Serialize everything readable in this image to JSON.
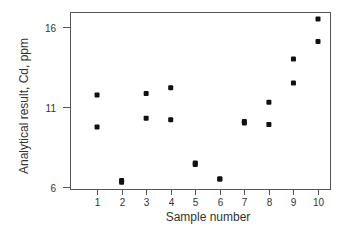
{
  "chart_data": {
    "type": "scatter",
    "title": "",
    "xlabel": "Sample number",
    "ylabel": "Analytical result, Cd, ppm",
    "x_ticks": [
      "1",
      "2",
      "3",
      "4",
      "5",
      "6",
      "7",
      "8",
      "9",
      "10"
    ],
    "y_ticks": [
      "6",
      "11",
      "16"
    ],
    "xlim": [
      0,
      10.5
    ],
    "ylim": [
      5.9,
      16.9
    ],
    "grid": false,
    "legend": null,
    "marker_color": "#111111",
    "series": [
      {
        "name": "Replicate A",
        "x": [
          1,
          2,
          3,
          4,
          5,
          6,
          7,
          8,
          9,
          10
        ],
        "y": [
          11.75,
          6.4,
          11.85,
          12.2,
          7.5,
          6.5,
          10.1,
          11.3,
          14.0,
          16.5
        ]
      },
      {
        "name": "Replicate B",
        "x": [
          1,
          2,
          3,
          4,
          5,
          6,
          7,
          8,
          9,
          10
        ],
        "y": [
          9.75,
          6.3,
          10.3,
          10.2,
          7.4,
          6.5,
          10.0,
          9.9,
          12.5,
          15.1
        ]
      }
    ]
  }
}
